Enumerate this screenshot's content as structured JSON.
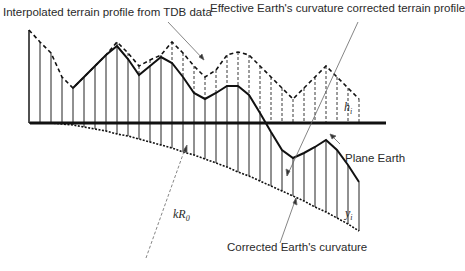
{
  "labels": {
    "interpolated": "Interpolated terrain profile from TDB data",
    "effective": "Effective Earth's curvature corrected terrain profile",
    "plane_earth": "Plane Earth",
    "corrected_curvature": "Corrected Earth's curvature",
    "h_i": "h",
    "h_i_sub": "i",
    "y_i": "y",
    "y_i_sub": "i",
    "kR0": "kR",
    "kR0_sub": "0"
  },
  "diagram": {
    "baseline_y": 123,
    "x_start": 29,
    "step": 11,
    "interpolated_profile_top_y": [
      30,
      42,
      53,
      77,
      88,
      77,
      66,
      55,
      42,
      53,
      66,
      60,
      55,
      42,
      53,
      66,
      77,
      70,
      55,
      52,
      55,
      66,
      77,
      88,
      99,
      88,
      77,
      66,
      77,
      88,
      99
    ],
    "corrected_profile_top_y": [
      null,
      null,
      null,
      null,
      88,
      77,
      66,
      55,
      46,
      59,
      75,
      66,
      57,
      63,
      77,
      93,
      99,
      93,
      86,
      86,
      95,
      113,
      132,
      150,
      158,
      153,
      147,
      140,
      150,
      165,
      182
    ],
    "curvature_y": [
      123,
      123,
      123,
      124,
      125,
      127,
      129,
      131,
      134,
      136,
      139,
      142,
      145,
      148,
      152,
      155,
      159,
      163,
      167,
      172,
      176,
      181,
      186,
      191,
      196,
      201,
      207,
      212,
      218,
      224,
      231
    ],
    "colors": {
      "line": "#111111",
      "leader": "#555555"
    }
  },
  "caption": {
    "visible": "partially cropped, illegible"
  }
}
